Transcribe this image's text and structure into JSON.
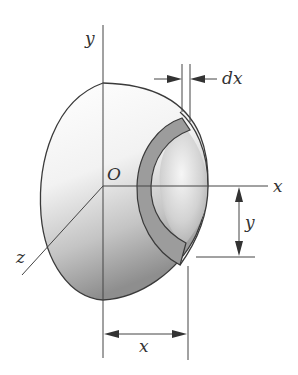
{
  "figure": {
    "labels": {
      "y_axis": "y",
      "x_axis": "x",
      "z_axis": "z",
      "origin": "O",
      "shell_thickness": "dx",
      "dim_height": "y",
      "dim_width": "x"
    },
    "colors": {
      "stroke": "#3a3a3a",
      "ring_fill": "#9a9a9a",
      "shade_dark": "#8c8c8c",
      "shade_light": "#f4f4f4"
    }
  }
}
